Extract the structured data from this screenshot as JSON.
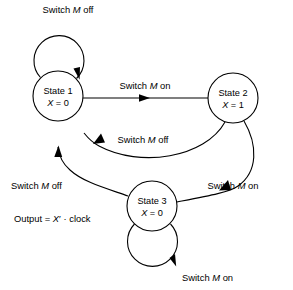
{
  "diagram": {
    "type": "state-transition-diagram",
    "title": "",
    "background_color": "#ffffff",
    "stroke_color": "#000000",
    "states": [
      {
        "id": "state1",
        "name": "State 1",
        "output_var": "X",
        "output_eq": "X = 0",
        "value": "0",
        "cx": 58,
        "cy": 96,
        "r": 25
      },
      {
        "id": "state2",
        "name": "State 2",
        "output_var": "X",
        "output_eq": "X = 1",
        "value": "1",
        "cx": 233,
        "cy": 98,
        "r": 25
      },
      {
        "id": "state3",
        "name": "State 3",
        "output_var": "X",
        "output_eq": "X = 0",
        "value": "0",
        "cx": 152,
        "cy": 206,
        "r": 25
      }
    ],
    "transitions": [
      {
        "id": "t-s1-self",
        "from": "state1",
        "to": "state1",
        "label_prefix": "Switch ",
        "label_var": "M",
        "label_suffix": " off",
        "label_x": 68,
        "label_y": 13
      },
      {
        "id": "t-s1-s2",
        "from": "state1",
        "to": "state2",
        "label_prefix": "Switch ",
        "label_var": "M",
        "label_suffix": " on",
        "label_x": 145,
        "label_y": 89
      },
      {
        "id": "t-s2-s1",
        "from": "state2",
        "to": "state1",
        "label_prefix": "Switch ",
        "label_var": "M",
        "label_suffix": " off",
        "label_x": 143,
        "label_y": 143
      },
      {
        "id": "t-s2-s3",
        "from": "state2",
        "to": "state3",
        "label_prefix": "Switch ",
        "label_var": "M",
        "label_suffix": " on",
        "label_x": 233,
        "label_y": 189
      },
      {
        "id": "t-s3-s1",
        "from": "state3",
        "to": "state1",
        "label_prefix": "Switch ",
        "label_var": "M",
        "label_suffix": " off",
        "label_x": 11,
        "label_y": 189
      },
      {
        "id": "t-s3-self",
        "from": "state3",
        "to": "state3",
        "label_prefix": "Switch ",
        "label_var": "M",
        "label_suffix": " on",
        "label_x": 182,
        "label_y": 281
      }
    ],
    "annotations": [
      {
        "id": "output-equation",
        "text_prefix": "Output = ",
        "text_var": "X",
        "text_prime": "′",
        "text_suffix": " · clock",
        "x": 14,
        "y": 222
      }
    ]
  }
}
